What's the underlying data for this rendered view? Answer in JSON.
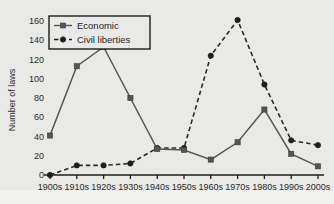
{
  "chart_data": {
    "type": "line",
    "title": "",
    "xlabel": "",
    "ylabel": "Number of laws",
    "categories": [
      "1900s",
      "1910s",
      "1920s",
      "1930s",
      "1940s",
      "1950s",
      "1960s",
      "1970s",
      "1980s",
      "1990s",
      "2000s"
    ],
    "ylim": [
      0,
      160
    ],
    "yticks": [
      0,
      20,
      40,
      60,
      80,
      100,
      120,
      140,
      160
    ],
    "grid": false,
    "legend_position": "top-left",
    "series": [
      {
        "name": "Economic",
        "marker": "square",
        "line_style": "solid",
        "color": "#555555",
        "values": [
          41,
          113,
          133,
          80,
          27,
          26,
          16,
          34,
          68,
          22,
          9
        ]
      },
      {
        "name": "Civil liberties",
        "marker": "circle",
        "line_style": "dashed",
        "color": "#1d1d1d",
        "values": [
          0,
          10,
          10,
          12,
          28,
          28,
          124,
          161,
          94,
          36,
          31
        ]
      }
    ]
  },
  "legend": {
    "items": [
      {
        "label": "Economic"
      },
      {
        "label": "Civil liberties"
      }
    ]
  },
  "axes": {
    "y_label": "Number of laws",
    "y_tick_labels": [
      "160",
      "140",
      "120",
      "100",
      "80",
      "60",
      "40",
      "20",
      "0"
    ],
    "x_tick_labels": [
      "1900s",
      "1910s",
      "1920s",
      "1930s",
      "1940s",
      "1950s",
      "1960s",
      "1970s",
      "1980s",
      "1990s",
      "2000s"
    ]
  },
  "colors": {
    "background": "#e9e9e7",
    "axis": "#1c1c1c",
    "economic": "#555555",
    "civil_liberties": "#1d1d1d"
  }
}
